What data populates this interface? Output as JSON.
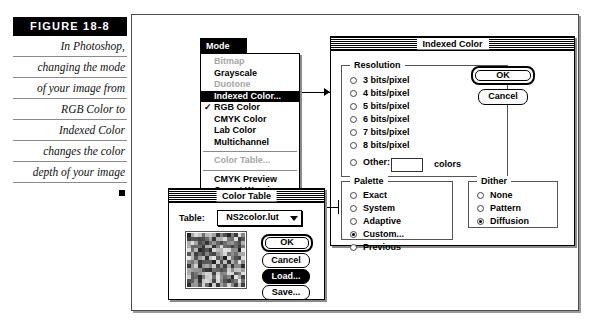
{
  "figure": {
    "label": "FIGURE 18-8",
    "caption_lines": [
      "In Photoshop,",
      "changing the mode",
      "of your image from",
      "RGB Color to",
      "Indexed Color",
      "changes the color",
      "depth of your image"
    ]
  },
  "mode_menu": {
    "title": "Mode",
    "items": [
      {
        "label": "Bitmap",
        "state": "disabled",
        "checked": false
      },
      {
        "label": "Grayscale",
        "state": "normal",
        "checked": false
      },
      {
        "label": "Duotone",
        "state": "disabled",
        "checked": false
      },
      {
        "label": "Indexed Color...",
        "state": "highlighted",
        "checked": false
      },
      {
        "label": "RGB Color",
        "state": "normal",
        "checked": true
      },
      {
        "label": "CMYK Color",
        "state": "normal",
        "checked": false
      },
      {
        "label": "Lab Color",
        "state": "normal",
        "checked": false
      },
      {
        "label": "Multichannel",
        "state": "normal",
        "checked": false
      },
      {
        "label": "Color Table...",
        "state": "disabled",
        "checked": false
      },
      {
        "label": "CMYK Preview",
        "state": "normal",
        "checked": false
      },
      {
        "label": "Gamut Warning",
        "state": "normal",
        "checked": false
      }
    ],
    "check_glyph": "✓"
  },
  "indexed_color_dialog": {
    "title": "Indexed Color",
    "resolution": {
      "legend": "Resolution",
      "options": [
        {
          "label": "3 bits/pixel",
          "selected": false
        },
        {
          "label": "4 bits/pixel",
          "selected": false
        },
        {
          "label": "5 bits/pixel",
          "selected": false
        },
        {
          "label": "6 bits/pixel",
          "selected": false
        },
        {
          "label": "7 bits/pixel",
          "selected": false
        },
        {
          "label": "8 bits/pixel",
          "selected": false
        }
      ],
      "other_label": "Other:",
      "other_value": "",
      "other_suffix": "colors"
    },
    "palette": {
      "legend": "Palette",
      "options": [
        {
          "label": "Exact",
          "selected": false
        },
        {
          "label": "System",
          "selected": false
        },
        {
          "label": "Adaptive",
          "selected": false
        },
        {
          "label": "Custom...",
          "selected": true
        },
        {
          "label": "Previous",
          "selected": false
        }
      ]
    },
    "dither": {
      "legend": "Dither",
      "options": [
        {
          "label": "None",
          "selected": false
        },
        {
          "label": "Pattern",
          "selected": false
        },
        {
          "label": "Diffusion",
          "selected": true
        }
      ]
    },
    "buttons": {
      "ok": "OK",
      "cancel": "Cancel"
    }
  },
  "color_table_dialog": {
    "title": "Color Table",
    "table_label": "Table:",
    "table_value": "NS2color.lut",
    "buttons": {
      "ok": "OK",
      "cancel": "Cancel",
      "load": "Load...",
      "save": "Save..."
    }
  },
  "colors": {
    "highlight": "#000000",
    "dialog_bg": "#ffffff",
    "disabled_text": "#a6a6a6",
    "frame": "#4a4a4a"
  }
}
